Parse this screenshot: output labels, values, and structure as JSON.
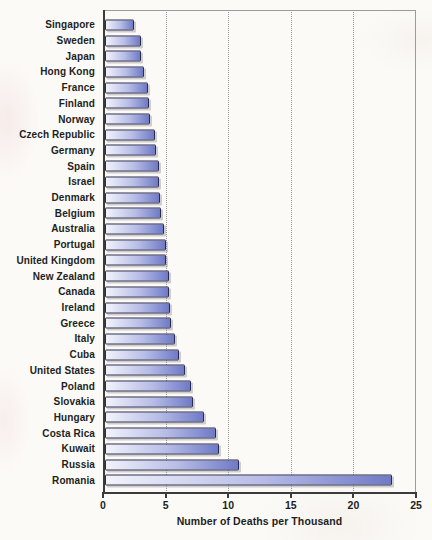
{
  "chart_data": {
    "type": "bar",
    "orientation": "horizontal",
    "title": "",
    "xlabel": "Number of Deaths per Thousand",
    "ylabel": "",
    "xlim": [
      0,
      25
    ],
    "x_ticks": [
      0,
      5,
      10,
      15,
      20,
      25
    ],
    "grid": "vertical dotted gridlines at 5, 10, 15, 20; gray frame line at 25 and top",
    "legend": "none",
    "categories": [
      "Singapore",
      "Sweden",
      "Japan",
      "Hong Kong",
      "France",
      "Finland",
      "Norway",
      "Czech Republic",
      "Germany",
      "Spain",
      "Israel",
      "Denmark",
      "Belgium",
      "Australia",
      "Portugal",
      "United Kingdom",
      "New Zealand",
      "Canada",
      "Ireland",
      "Greece",
      "Italy",
      "Cuba",
      "United States",
      "Poland",
      "Slovakia",
      "Hungary",
      "Costa Rica",
      "Kuwait",
      "Russia",
      "Romania"
    ],
    "values": [
      2.3,
      2.9,
      2.9,
      3.1,
      3.4,
      3.5,
      3.6,
      4.0,
      4.1,
      4.3,
      4.3,
      4.4,
      4.5,
      4.7,
      4.9,
      4.9,
      5.1,
      5.1,
      5.2,
      5.3,
      5.6,
      5.9,
      6.4,
      6.9,
      7.0,
      7.9,
      8.9,
      9.1,
      10.7,
      22.9
    ],
    "colors": {
      "bar_gradient_start": "#f2f3fb",
      "bar_gradient_end": "#6f7ac7",
      "bar_border": "#2b2b52",
      "axis": "#3b3b3b",
      "frame": "#9b9b9b",
      "gridline": "#97979d",
      "label_text": "#211f1d",
      "background": "#fcfaf7"
    }
  }
}
